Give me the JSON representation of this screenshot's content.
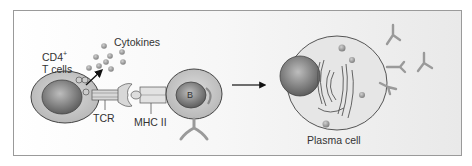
{
  "labels": {
    "t_cell": "CD4",
    "t_cell_sup": "+",
    "t_cell_line2": "T cells",
    "cytokines": "Cytokines",
    "tcr": "TCR",
    "mhc": "MHC II",
    "b_cell": "B",
    "plasma_cell": "Plasma cell"
  },
  "colors": {
    "frame_border": "#9a9a9a",
    "cell_fill": "#c9c9c9",
    "nucleus_fill": "#7d7d7d",
    "antibody": "#9a9a9a",
    "text": "#333333"
  }
}
